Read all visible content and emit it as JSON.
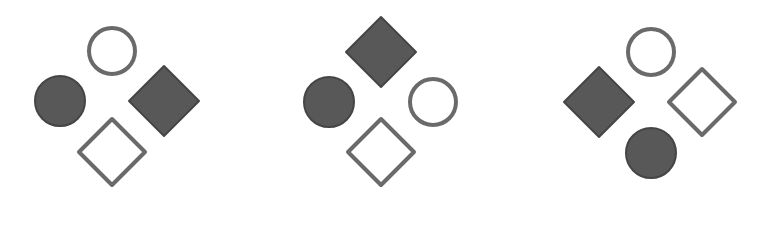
{
  "colors": {
    "background": "#ffffff",
    "filled_fill": "#585858",
    "filled_edge": "#454545",
    "outline_stroke": "#6a6a6a"
  },
  "panels": [
    {
      "id": "panel-1",
      "shapes": [
        {
          "kind": "circle",
          "style": "outline",
          "cx": 112,
          "cy": 51,
          "r": 25
        },
        {
          "kind": "circle",
          "style": "filled",
          "cx": 60,
          "cy": 101,
          "r": 26
        },
        {
          "kind": "diamond",
          "style": "filled",
          "cx": 164,
          "cy": 101,
          "h": 36
        },
        {
          "kind": "diamond",
          "style": "outline",
          "cx": 112,
          "cy": 152,
          "h": 35
        }
      ]
    },
    {
      "id": "panel-2",
      "shapes": [
        {
          "kind": "diamond",
          "style": "filled",
          "cx": 381,
          "cy": 52,
          "h": 36
        },
        {
          "kind": "circle",
          "style": "filled",
          "cx": 329,
          "cy": 102,
          "r": 26
        },
        {
          "kind": "circle",
          "style": "outline",
          "cx": 433,
          "cy": 102,
          "r": 25
        },
        {
          "kind": "diamond",
          "style": "outline",
          "cx": 381,
          "cy": 152,
          "h": 35
        }
      ]
    },
    {
      "id": "panel-3",
      "shapes": [
        {
          "kind": "circle",
          "style": "outline",
          "cx": 651,
          "cy": 52,
          "r": 25
        },
        {
          "kind": "diamond",
          "style": "filled",
          "cx": 599,
          "cy": 102,
          "h": 36
        },
        {
          "kind": "diamond",
          "style": "outline",
          "cx": 702,
          "cy": 102,
          "h": 35
        },
        {
          "kind": "circle",
          "style": "filled",
          "cx": 651,
          "cy": 153,
          "r": 26
        }
      ]
    }
  ]
}
